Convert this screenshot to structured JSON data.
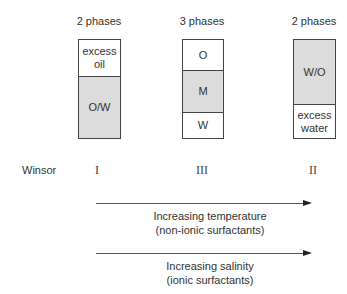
{
  "diagram": {
    "columns": [
      {
        "phase_label": "2 phases",
        "winsor_type": "I",
        "segments": [
          {
            "label": "excess oil",
            "shaded": false
          },
          {
            "label": "O/W",
            "shaded": true
          }
        ]
      },
      {
        "phase_label": "3 phases",
        "winsor_type": "III",
        "segments": [
          {
            "label": "O",
            "shaded": false
          },
          {
            "label": "M",
            "shaded": true
          },
          {
            "label": "W",
            "shaded": false
          }
        ]
      },
      {
        "phase_label": "2 phases",
        "winsor_type": "II",
        "segments": [
          {
            "label": "W/O",
            "shaded": true
          },
          {
            "label": "excess water",
            "shaded": false
          }
        ]
      }
    ],
    "winsor_label": "Winsor",
    "arrows": [
      {
        "line1": "Increasing temperature",
        "line2": "(non-ionic surfactants)"
      },
      {
        "line1": "Increasing salinity",
        "line2": "(ionic surfactants)"
      }
    ],
    "colors": {
      "shaded": "#dcdcdc",
      "border": "#444444",
      "text": "#333333"
    }
  }
}
